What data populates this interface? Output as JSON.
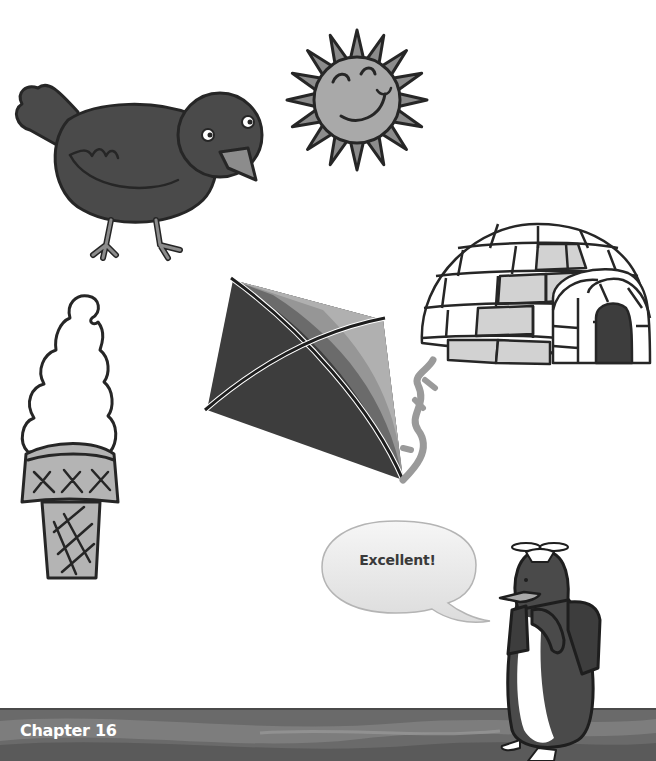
{
  "page": {
    "footer_label": "Chapter 16",
    "colors": {
      "band_dark": "#5f5f5f",
      "band_mid": "#7a7a7a",
      "band_light": "#9a9a9a",
      "outline": "#262626",
      "bird_body": "#4a4a4a",
      "sun_fill": "#a9a9a9",
      "igloo_shade": "#d2d2d2",
      "kite_dark": "#3d3d3d",
      "kite_mid": "#6b6b6b",
      "kite_light": "#969696"
    }
  },
  "illustrations": [
    {
      "id": "bird",
      "label": "bird"
    },
    {
      "id": "sun",
      "label": "sun"
    },
    {
      "id": "igloo",
      "label": "igloo"
    },
    {
      "id": "kite",
      "label": "kite"
    },
    {
      "id": "ice-cream",
      "label": "ice cream cone"
    },
    {
      "id": "penguin",
      "label": "penguin with propeller cap and backpack"
    }
  ],
  "speech_bubble": {
    "text": "Excellent!"
  }
}
